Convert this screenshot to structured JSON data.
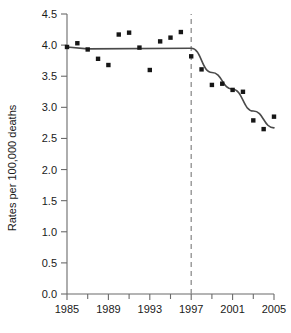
{
  "chart_data": {
    "type": "scatter",
    "title": "",
    "xlabel": "",
    "ylabel": "Rates per 100,000 deaths",
    "xlim": [
      1985,
      2005
    ],
    "ylim": [
      0.0,
      4.5
    ],
    "grid": false,
    "legend": null,
    "x_tick_labels": [
      "1985",
      "1989",
      "1993",
      "1997",
      "2001",
      "2005"
    ],
    "x_tick_values": [
      1985,
      1989,
      1993,
      1997,
      2001,
      2005
    ],
    "x_minor_tick_values": [
      1987,
      1991,
      1995,
      1999,
      2003
    ],
    "y_tick_labels": [
      "0.0",
      "0.5",
      "1.0",
      "1.5",
      "2.0",
      "2.5",
      "3.0",
      "3.5",
      "4.0",
      "4.5"
    ],
    "y_tick_values": [
      0.0,
      0.5,
      1.0,
      1.5,
      2.0,
      2.5,
      3.0,
      3.5,
      4.0,
      4.5
    ],
    "x": [
      1985,
      1986,
      1987,
      1988,
      1989,
      1990,
      1991,
      1992,
      1993,
      1994,
      1995,
      1996,
      1997,
      1998,
      1999,
      2000,
      2001,
      2002,
      2003,
      2004,
      2005
    ],
    "values": [
      3.97,
      4.03,
      3.93,
      3.78,
      3.68,
      4.17,
      4.2,
      3.96,
      3.6,
      4.06,
      4.12,
      4.21,
      3.82,
      3.61,
      3.36,
      3.38,
      3.28,
      3.25,
      2.79,
      2.65,
      2.85
    ],
    "series": [
      {
        "name": "observed-rates",
        "type": "scatter",
        "marker": "square",
        "color": "#161616",
        "x": [
          1985,
          1986,
          1987,
          1988,
          1989,
          1990,
          1991,
          1992,
          1993,
          1994,
          1995,
          1996,
          1997,
          1998,
          1999,
          2000,
          2001,
          2002,
          2003,
          2004,
          2005
        ],
        "values": [
          3.97,
          4.03,
          3.93,
          3.78,
          3.68,
          4.17,
          4.2,
          3.96,
          3.6,
          4.06,
          4.12,
          4.21,
          3.82,
          3.61,
          3.36,
          3.38,
          3.28,
          3.25,
          2.79,
          2.65,
          2.85
        ]
      },
      {
        "name": "fitted-joinpoint-trend",
        "type": "line",
        "color": "#4a4a4a",
        "x": [
          1985,
          1987,
          1997,
          1999,
          2001,
          2003,
          2005
        ],
        "values": [
          3.97,
          3.94,
          3.95,
          3.56,
          3.29,
          2.94,
          2.67
        ]
      }
    ],
    "annotations": [
      {
        "name": "joinpoint-marker",
        "type": "vertical-dashed-line",
        "x": 1997,
        "color": "#8d8d8d"
      }
    ]
  },
  "axes": {
    "y_title": "Rates per 100,000 deaths"
  }
}
